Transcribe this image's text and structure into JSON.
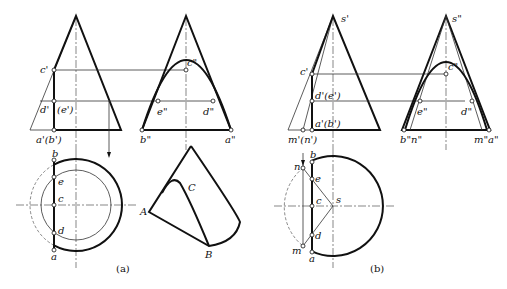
{
  "figure": {
    "panels": [
      {
        "id": "a",
        "caption": "(a)",
        "front_view_labels": [
          "c'",
          "d'",
          "(e')",
          "a'(b')"
        ],
        "side_view_labels": [
          "c\"",
          "e\"",
          "d\"",
          "b\"",
          "a\""
        ],
        "top_view_labels": [
          "b",
          "e",
          "c",
          "d",
          "a"
        ],
        "pictorial_labels": [
          "A",
          "B",
          "C"
        ]
      },
      {
        "id": "b",
        "caption": "(b)",
        "front_view_labels": [
          "s'",
          "c'",
          "d'(e')",
          "a'(b')",
          "m'(n')"
        ],
        "side_view_labels": [
          "s\"",
          "c\"",
          "e\"",
          "d\"",
          "b\"n\"",
          "m\"a\""
        ],
        "top_view_labels": [
          "n",
          "b",
          "e",
          "c",
          "s",
          "d",
          "m",
          "a"
        ]
      }
    ],
    "labels": {
      "a_c1": "c'",
      "a_d1": "d'",
      "a_e1": "(e')",
      "a_ab1": "a'(b')",
      "a_c2": "c\"",
      "a_e2": "e\"",
      "a_d2": "d\"",
      "a_b2": "b\"",
      "a_a2": "a\"",
      "a_b": "b",
      "a_e": "e",
      "a_c": "c",
      "a_d": "d",
      "a_a": "a",
      "A": "A",
      "B": "B",
      "C": "C",
      "b_s1": "s'",
      "b_c1": "c'",
      "b_de1": "d'(e')",
      "b_ab1": "a'(b')",
      "b_mn1": "m'(n')",
      "b_s2": "s\"",
      "b_c2": "c\"",
      "b_e2": "e\"",
      "b_d2": "d\"",
      "b_bn2": "b\"n\"",
      "b_ma2": "m\"a\"",
      "b_n": "n",
      "b_b": "b",
      "b_e": "e",
      "b_c": "c",
      "b_s": "s",
      "b_d": "d",
      "b_m": "m",
      "b_a": "a",
      "cap_a": "(a)",
      "cap_b": "(b)"
    }
  }
}
